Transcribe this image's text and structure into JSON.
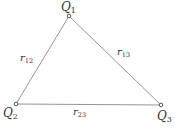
{
  "diagram": {
    "type": "triangle-charge-configuration",
    "colors": {
      "line": "#888888",
      "text": "#333333",
      "background": "#ffffff"
    },
    "nodes": [
      {
        "id": "Q1",
        "symbol": "Q",
        "subscript": "1",
        "x": 69,
        "y": 16
      },
      {
        "id": "Q2",
        "symbol": "Q",
        "subscript": "2",
        "x": 16,
        "y": 104
      },
      {
        "id": "Q3",
        "symbol": "Q",
        "subscript": "3",
        "x": 161,
        "y": 105
      }
    ],
    "edges": [
      {
        "from": "Q1",
        "to": "Q2",
        "symbol": "r",
        "subscript": "12"
      },
      {
        "from": "Q1",
        "to": "Q3",
        "symbol": "r",
        "subscript": "13"
      },
      {
        "from": "Q2",
        "to": "Q3",
        "symbol": "r",
        "subscript": "23"
      }
    ]
  },
  "labels": {
    "q1": {
      "symbol": "Q",
      "sub": "1"
    },
    "q2": {
      "symbol": "Q",
      "sub": "2"
    },
    "q3": {
      "symbol": "Q",
      "sub": "3"
    },
    "r12": {
      "symbol": "r",
      "sub": "12"
    },
    "r13": {
      "symbol": "r",
      "sub": "13"
    },
    "r23": {
      "symbol": "r",
      "sub": "23"
    }
  }
}
